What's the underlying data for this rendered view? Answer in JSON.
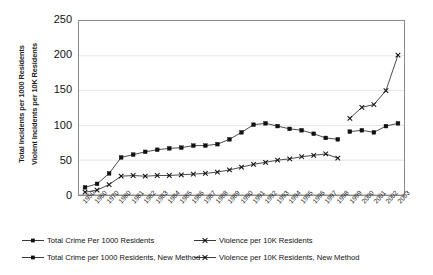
{
  "axes": {
    "ylabel_line1": "Total Incidents per 1000 Residents",
    "ylabel_line2": "Violent Incidents per 10K Residents",
    "yticks": [
      "250",
      "200",
      "150",
      "100",
      "50",
      "0"
    ],
    "xticks": [
      "1950",
      "1960",
      "1970",
      "1980",
      "1981",
      "1982",
      "1983",
      "1984",
      "1985",
      "1986",
      "1987",
      "1988",
      "1989",
      "1990",
      "1991",
      "1992",
      "1993",
      "1994",
      "1995",
      "1996",
      "1997",
      "1998",
      "1999",
      "2000",
      "2001",
      "2002",
      "2003"
    ]
  },
  "legend": {
    "items": [
      {
        "label": "Total Crime Per 1000 Residents",
        "marker": "square-line-marker",
        "color": "#111111"
      },
      {
        "label": "Violence per 10K Residents",
        "marker": "cross-line-marker",
        "color": "#444444"
      },
      {
        "label": "Total Crime per 1000 Residents, New Method",
        "marker": "square-line-marker",
        "color": "#111111"
      },
      {
        "label": "Violence per 10K Residents, New Method",
        "marker": "cross-line-marker",
        "color": "#111111"
      }
    ]
  },
  "chart_data": {
    "type": "line",
    "title": "",
    "xlabel": "",
    "ylabel": "Total Incidents per 1000 Residents / Violent Incidents per 10K Residents",
    "ylim": [
      0,
      250
    ],
    "yticks": [
      0,
      50,
      100,
      150,
      200,
      250
    ],
    "grid": "horizontal",
    "legend_position": "bottom",
    "x": [
      "1950",
      "1960",
      "1970",
      "1980",
      "1981",
      "1982",
      "1983",
      "1984",
      "1985",
      "1986",
      "1987",
      "1988",
      "1989",
      "1990",
      "1991",
      "1992",
      "1993",
      "1994",
      "1995",
      "1996",
      "1997",
      "1998",
      "1999",
      "2000",
      "2001",
      "2002",
      "2003"
    ],
    "series": [
      {
        "name": "Total Crime Per 1000 Residents",
        "marker": "square",
        "x": [
          "1950",
          "1960",
          "1970",
          "1980",
          "1981",
          "1982",
          "1983",
          "1984",
          "1985",
          "1986",
          "1987",
          "1988",
          "1989",
          "1990",
          "1991",
          "1992",
          "1993",
          "1994",
          "1995",
          "1996",
          "1997",
          "1998"
        ],
        "values": [
          11,
          16,
          31,
          54,
          58,
          62,
          65,
          67,
          68,
          71,
          71,
          73,
          80,
          90,
          101,
          103,
          99,
          95,
          93,
          88,
          82,
          80
        ]
      },
      {
        "name": "Violence per 10K Residents",
        "marker": "cross",
        "x": [
          "1950",
          "1960",
          "1970",
          "1980",
          "1981",
          "1982",
          "1983",
          "1984",
          "1985",
          "1986",
          "1987",
          "1988",
          "1989",
          "1990",
          "1991",
          "1992",
          "1993",
          "1994",
          "1995",
          "1996",
          "1997",
          "1998"
        ],
        "values": [
          4,
          7,
          15,
          27,
          28,
          27,
          28,
          28,
          29,
          30,
          31,
          33,
          36,
          40,
          44,
          47,
          50,
          52,
          55,
          57,
          59,
          53
        ]
      },
      {
        "name": "Total Crime per 1000 Residents, New Method",
        "marker": "square",
        "x": [
          "1999",
          "2000",
          "2001",
          "2002",
          "2003"
        ],
        "values": [
          91,
          93,
          90,
          99,
          103
        ]
      },
      {
        "name": "Violence per 10K Residents, New Method",
        "marker": "cross",
        "x": [
          "1999",
          "2000",
          "2001",
          "2002",
          "2003"
        ],
        "values": [
          110,
          126,
          130,
          150,
          201
        ]
      }
    ]
  }
}
